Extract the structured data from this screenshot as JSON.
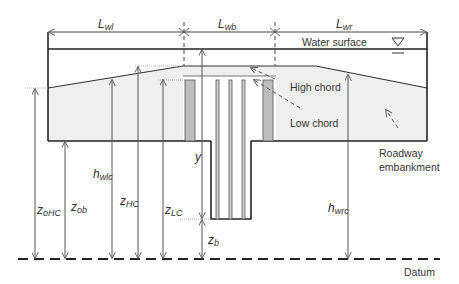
{
  "diagram": {
    "dimensions": {
      "L_wl": {
        "main": "L",
        "sub": "wl"
      },
      "L_wb": {
        "main": "L",
        "sub": "wb"
      },
      "L_wr": {
        "main": "L",
        "sub": "wr"
      }
    },
    "labels": {
      "water_surface": "Water surface",
      "high_chord": "High chord",
      "low_chord": "Low chord",
      "roadway_line1": "Roadway",
      "roadway_line2": "embankment",
      "datum": "Datum",
      "y": "y"
    },
    "variables": {
      "z_oHC": {
        "main": "z",
        "sub": "oHC"
      },
      "z_ob": {
        "main": "z",
        "sub": "ob"
      },
      "h_wlc": {
        "main": "h",
        "sub": "wlc"
      },
      "z_HC": {
        "main": "z",
        "sub": "HC"
      },
      "z_LC": {
        "main": "z",
        "sub": "LC"
      },
      "z_b": {
        "main": "z",
        "sub": "b"
      },
      "h_wrc": {
        "main": "h",
        "sub": "wrc"
      }
    },
    "colors": {
      "line": "#222222",
      "embankment_fill": "#efefef",
      "abutment_fill": "#bdbdbd",
      "dim_line": "#555555"
    }
  }
}
